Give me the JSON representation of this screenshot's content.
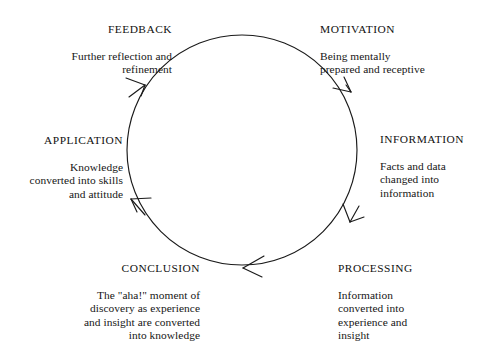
{
  "diagram": {
    "type": "cycle",
    "direction": "clockwise",
    "stroke_color": "#1a1a1a",
    "text_color": "#161616",
    "background_color": "#ffffff",
    "circle": {
      "center_x": 242,
      "center_y": 150,
      "radius": 115
    },
    "stages": [
      {
        "id": "motivation",
        "title": "MOTIVATION",
        "description": "Being mentally\nprepared and receptive",
        "align": "left",
        "angle_deg": 315
      },
      {
        "id": "information",
        "title": "INFORMATION",
        "description": "Facts and data\nchanged into\ninformation",
        "align": "left",
        "angle_deg": 0
      },
      {
        "id": "processing",
        "title": "PROCESSING",
        "description": "Information\nconverted into\nexperience and\ninsight",
        "align": "left",
        "angle_deg": 45
      },
      {
        "id": "conclusion",
        "title": "CONCLUSION",
        "description": "The \"aha!\" moment of\ndiscovery as experience\nand insight are converted\ninto knowledge",
        "align": "right",
        "angle_deg": 135
      },
      {
        "id": "application",
        "title": "APPLICATION",
        "description": "Knowledge\nconverted into skills\nand attitude",
        "align": "right",
        "angle_deg": 180
      },
      {
        "id": "feedback",
        "title": "FEEDBACK",
        "description": "Further reflection and\nrefinement",
        "align": "right",
        "angle_deg": 225
      }
    ],
    "arrowheads": [
      {
        "id": "arrow-to-information",
        "at_angle_deg": 305,
        "points": "clockwise"
      },
      {
        "id": "arrow-to-processing",
        "at_angle_deg": 50,
        "points": "clockwise"
      },
      {
        "id": "arrow-to-conclusion",
        "at_angle_deg": 98,
        "points": "clockwise"
      },
      {
        "id": "arrow-to-application",
        "at_angle_deg": 152,
        "points": "clockwise"
      },
      {
        "id": "arrow-to-feedback",
        "at_angle_deg": 216,
        "points": "clockwise"
      }
    ]
  }
}
